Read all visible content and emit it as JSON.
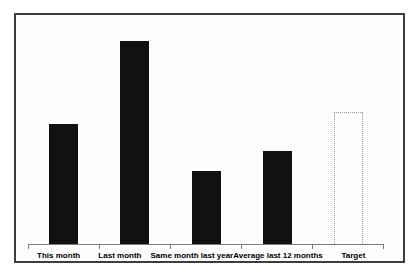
{
  "chart_data": {
    "type": "bar",
    "title": "",
    "xlabel": "",
    "ylabel": "",
    "categories": [
      "This month",
      "Last month",
      "Same month last year",
      "Average last 12 months",
      "Target"
    ],
    "values": [
      59,
      100,
      36,
      46,
      65
    ],
    "bar_styles": [
      "solid",
      "solid",
      "solid",
      "solid",
      "dotted-outline"
    ],
    "ylim": [
      0,
      113
    ],
    "grid": false,
    "legend": false,
    "colors": {
      "bar_fill": "#111111",
      "target_outline": "#999999",
      "axis": "#7e7e7e",
      "frame_border": "#3d3d3d",
      "plot_background": "#fdfdfd",
      "label_text": "#000000"
    }
  }
}
